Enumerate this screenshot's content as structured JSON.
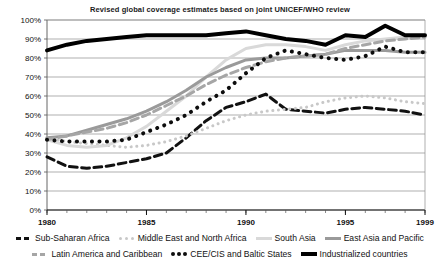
{
  "chart_data": {
    "type": "line",
    "title": "Revised global coverage estimates based on joint UNICEF/WHO review",
    "xlabel": "",
    "ylabel": "",
    "xlim": [
      1980,
      1999
    ],
    "ylim": [
      0,
      100
    ],
    "grid": true,
    "legend_position": "bottom",
    "x_ticks": [
      "1980",
      "1985",
      "1990",
      "1995",
      "1999"
    ],
    "x_tick_values": [
      1980,
      1985,
      1990,
      1995,
      1999
    ],
    "y_ticks": [
      "0%",
      "10%",
      "20%",
      "30%",
      "40%",
      "50%",
      "60%",
      "70%",
      "80%",
      "90%",
      "100%"
    ],
    "y_tick_values": [
      0,
      10,
      20,
      30,
      40,
      50,
      60,
      70,
      80,
      90,
      100
    ],
    "x": [
      1980,
      1981,
      1982,
      1983,
      1984,
      1985,
      1986,
      1987,
      1988,
      1989,
      1990,
      1991,
      1992,
      1993,
      1994,
      1995,
      1996,
      1997,
      1998,
      1999
    ],
    "series": [
      {
        "name": "Sub-Saharan Africa",
        "color": "#111111",
        "style": "dashed",
        "width": 3,
        "values": [
          28,
          23,
          22,
          23,
          25,
          27,
          30,
          38,
          47,
          54,
          57,
          61,
          53,
          52,
          51,
          53,
          54,
          53,
          52,
          50
        ]
      },
      {
        "name": "Middle East and North Africa",
        "color": "#c8c8c8",
        "style": "dotted",
        "width": 3,
        "values": [
          38,
          36,
          35,
          34,
          33,
          34,
          36,
          39,
          43,
          47,
          50,
          52,
          53,
          54,
          57,
          59,
          60,
          59,
          57,
          56
        ]
      },
      {
        "name": "South Asia",
        "color": "#d9d9d9",
        "style": "solid",
        "width": 3,
        "values": [
          37,
          34,
          33,
          34,
          38,
          44,
          52,
          60,
          70,
          79,
          85,
          87,
          87,
          86,
          84,
          87,
          89,
          90,
          91,
          92
        ]
      },
      {
        "name": "East Asia and Pacific",
        "color": "#9a9a9a",
        "style": "solid",
        "width": 3,
        "values": [
          38,
          39,
          42,
          45,
          48,
          52,
          57,
          63,
          70,
          75,
          79,
          80,
          80,
          81,
          82,
          84,
          84,
          84,
          83,
          83
        ]
      },
      {
        "name": "Latin America and Caribbean",
        "color": "#a6a6a6",
        "style": "dashed",
        "width": 3,
        "values": [
          37,
          39,
          41,
          43,
          46,
          50,
          55,
          60,
          66,
          71,
          75,
          78,
          80,
          81,
          82,
          85,
          87,
          89,
          90,
          91
        ]
      },
      {
        "name": "CEE/CIS and Baltic States",
        "color": "#0d0d0d",
        "style": "dotted",
        "width": 4,
        "values": [
          37,
          36,
          36,
          36,
          37,
          41,
          45,
          50,
          57,
          63,
          72,
          80,
          84,
          82,
          80,
          79,
          81,
          86,
          83,
          83
        ]
      },
      {
        "name": "Industrialized countries",
        "color": "#000000",
        "style": "solid",
        "width": 4,
        "values": [
          84,
          87,
          89,
          90,
          91,
          92,
          92,
          92,
          92,
          93,
          94,
          92,
          90,
          89,
          87,
          92,
          91,
          97,
          92,
          92
        ]
      }
    ]
  },
  "legend": {
    "rows": [
      [
        {
          "label": "Sub-Saharan Africa",
          "series": 0
        },
        {
          "label": "Middle East and North Africa",
          "series": 1
        },
        {
          "label": "South Asia",
          "series": 2
        },
        {
          "label": "East Asia and Pacific",
          "series": 3
        }
      ],
      [
        {
          "label": "Latin America and Caribbean",
          "series": 4
        },
        {
          "label": "CEE/CIS and Baltic States",
          "series": 5
        },
        {
          "label": "Industrialized countries",
          "series": 6
        }
      ]
    ]
  },
  "axis_colors": {
    "grid": "#8d8d8d",
    "axis": "#555555",
    "text": "#111111"
  }
}
